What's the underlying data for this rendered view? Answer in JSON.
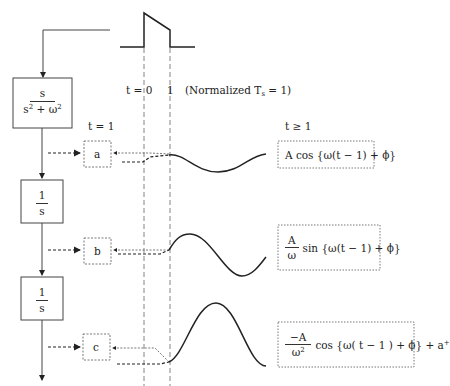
{
  "labels": {
    "t0": "t = 0",
    "t1": "1",
    "normalized_prefix": "(Normalized T",
    "normalized_sub": "s",
    "normalized_suffix": " = 1)",
    "t_eq_1": "t = 1",
    "t_ge_1": "t ≥ 1"
  },
  "blocks": [
    {
      "id": "block-1",
      "numerator": "s",
      "denominator": "s",
      "denominator_exp": "2",
      "denominator_rest": " + ω",
      "denominator_exp2": "2"
    },
    {
      "id": "block-2",
      "numerator": "1",
      "denominator": "s"
    },
    {
      "id": "block-3",
      "numerator": "1",
      "denominator": "s"
    }
  ],
  "states": [
    {
      "id": "a",
      "label": "a"
    },
    {
      "id": "b",
      "label": "b"
    },
    {
      "id": "c",
      "label": "c"
    }
  ],
  "formulas": {
    "a": {
      "text": "A cos {ω(t − 1) + ϕ}"
    },
    "b": {
      "num": "A",
      "den": "ω",
      "text": "sin {ω(t − 1) + ϕ}"
    },
    "c": {
      "num": "−A",
      "den": "ω",
      "den_exp": "2",
      "text": "cos {ω( t − 1 ) + ϕ} + a",
      "text_sup": "+"
    }
  },
  "colors": {
    "line": "#333333",
    "dashed": "#555555"
  }
}
